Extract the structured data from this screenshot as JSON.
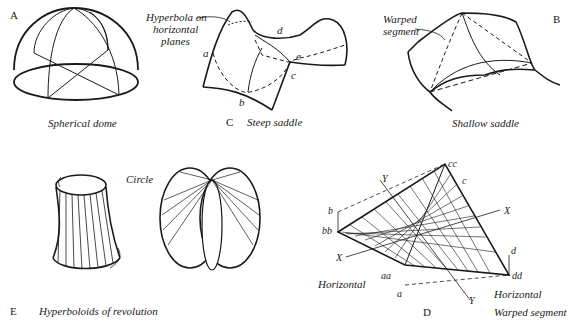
{
  "panels": {
    "A": {
      "letter": "A",
      "caption": "Spherical dome"
    },
    "C": {
      "letter": "C",
      "caption": "Steep saddle",
      "annotation": "Hyperbola on\nhorizontal\nplanes",
      "annotation_lines": [
        "Hyperbola on",
        "horizontal",
        "planes"
      ],
      "points": {
        "a": "a",
        "b": "b",
        "c": "c",
        "d": "d",
        "e": "e"
      }
    },
    "B": {
      "letter": "B",
      "caption": "Shallow saddle",
      "annotation_lines": [
        "Warped",
        "segment"
      ]
    },
    "E": {
      "letter": "E",
      "caption": "Hyperboloids of revolution",
      "annotation": "Circle"
    },
    "D": {
      "letter": "D",
      "caption": "Warped segment",
      "points": {
        "cc": "cc",
        "c": "c",
        "b": "b",
        "bb": "bb",
        "aa": "aa",
        "a": "a",
        "d": "d",
        "dd": "dd"
      },
      "axes": {
        "x1": "X",
        "x2": "X",
        "y1": "Y",
        "y2": "Y"
      },
      "horizontal_left": "Horizontal",
      "horizontal_right": "Horizontal"
    }
  }
}
